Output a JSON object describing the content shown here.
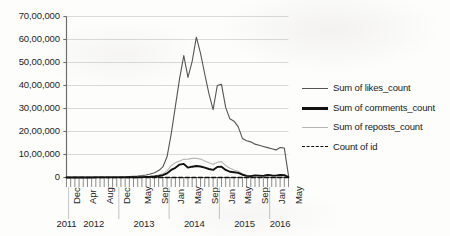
{
  "chart_data": {
    "type": "line",
    "title": "",
    "subtitle": "",
    "xlabel": "",
    "ylabel": "",
    "ylim": [
      0,
      7000000
    ],
    "ytick_labels": [
      "0",
      "10,00,000",
      "20,00,000",
      "30,00,000",
      "40,00,000",
      "50,00,000",
      "60,00,000",
      "70,00,000"
    ],
    "ytick_values": [
      0,
      1000000,
      2000000,
      3000000,
      4000000,
      5000000,
      6000000,
      7000000
    ],
    "grid": "horizontal",
    "legend_position": "right",
    "x_axis_type": "monthly",
    "xtick_labels": [
      "Dec",
      "Apr",
      "Aug",
      "Dec",
      "May",
      "Sep",
      "Jan",
      "May",
      "Sep",
      "Jan",
      "May",
      "Sep",
      "Jan",
      "May"
    ],
    "xtick_month_index": [
      0,
      4,
      8,
      12,
      17,
      21,
      25,
      29,
      33,
      37,
      41,
      45,
      49,
      53
    ],
    "year_groups": [
      {
        "label": "2011",
        "start_index": 0,
        "end_index": 0
      },
      {
        "label": "2012",
        "start_index": 1,
        "end_index": 12
      },
      {
        "label": "2013",
        "start_index": 13,
        "end_index": 24
      },
      {
        "label": "2014",
        "start_index": 25,
        "end_index": 36
      },
      {
        "label": "2015",
        "start_index": 37,
        "end_index": 48
      },
      {
        "label": "2016",
        "start_index": 49,
        "end_index": 53
      }
    ],
    "x": [
      "Dec 2011",
      "Jan 2012",
      "Feb 2012",
      "Mar 2012",
      "Apr 2012",
      "May 2012",
      "Jun 2012",
      "Jul 2012",
      "Aug 2012",
      "Sep 2012",
      "Oct 2012",
      "Nov 2012",
      "Dec 2012",
      "Jan 2013",
      "Feb 2013",
      "Mar 2013",
      "Apr 2013",
      "May 2013",
      "Jun 2013",
      "Jul 2013",
      "Aug 2013",
      "Sep 2013",
      "Oct 2013",
      "Nov 2013",
      "Dec 2013",
      "Jan 2014",
      "Feb 2014",
      "Mar 2014",
      "Apr 2014",
      "May 2014",
      "Jun 2014",
      "Jul 2014",
      "Aug 2014",
      "Sep 2014",
      "Oct 2014",
      "Nov 2014",
      "Dec 2014",
      "Jan 2015",
      "Feb 2015",
      "Mar 2015",
      "Apr 2015",
      "May 2015",
      "Jun 2015",
      "Jul 2015",
      "Aug 2015",
      "Sep 2015",
      "Oct 2015",
      "Nov 2015",
      "Dec 2015",
      "Jan 2016",
      "Feb 2016",
      "Mar 2016",
      "Apr 2016",
      "May 2016"
    ],
    "series": [
      {
        "name": "Sum of likes_count",
        "color": "#555555",
        "width": 1.1,
        "dash": "none",
        "values": [
          8000,
          9000,
          10000,
          11000,
          12000,
          13000,
          14000,
          15000,
          16000,
          17000,
          19000,
          21000,
          24000,
          28000,
          34000,
          42000,
          52000,
          66000,
          85000,
          110000,
          150000,
          210000,
          300000,
          460000,
          900000,
          1900000,
          3100000,
          4300000,
          5300000,
          4350000,
          5050000,
          6100000,
          5400000,
          4500000,
          3650000,
          2950000,
          4000000,
          4050000,
          3050000,
          2550000,
          2450000,
          2200000,
          1700000,
          1600000,
          1550000,
          1450000,
          1400000,
          1350000,
          1300000,
          1250000,
          1200000,
          1300000,
          1280000,
          80000
        ]
      },
      {
        "name": "Sum of comments_count",
        "color": "#111111",
        "width": 1.9,
        "dash": "none",
        "values": [
          2000,
          2200,
          2400,
          2600,
          2800,
          3000,
          3200,
          3500,
          3800,
          4100,
          4500,
          5000,
          5600,
          6400,
          7500,
          9000,
          11000,
          14000,
          18000,
          24000,
          33000,
          47000,
          68000,
          100000,
          180000,
          330000,
          420000,
          560000,
          590000,
          430000,
          470000,
          500000,
          480000,
          430000,
          370000,
          330000,
          460000,
          470000,
          330000,
          250000,
          230000,
          200000,
          120000,
          70000,
          60000,
          90000,
          80000,
          70000,
          110000,
          90000,
          80000,
          110000,
          100000,
          15000
        ]
      },
      {
        "name": "Sum of reposts_count",
        "color": "#b6b6b6",
        "width": 1.1,
        "dash": "none",
        "values": [
          3000,
          3200,
          3500,
          3800,
          4100,
          4400,
          4800,
          5200,
          5700,
          6300,
          7000,
          7900,
          9000,
          10500,
          12500,
          15000,
          18500,
          23000,
          30000,
          40000,
          55000,
          78000,
          112000,
          165000,
          290000,
          520000,
          640000,
          720000,
          790000,
          800000,
          830000,
          840000,
          800000,
          720000,
          640000,
          570000,
          660000,
          690000,
          520000,
          400000,
          330000,
          270000,
          160000,
          90000,
          70000,
          100000,
          90000,
          80000,
          120000,
          100000,
          90000,
          120000,
          110000,
          18000
        ]
      },
      {
        "name": "Count of id",
        "color": "#111111",
        "width": 1.5,
        "dash": "4,2.6",
        "values": [
          60,
          62,
          64,
          66,
          68,
          70,
          72,
          75,
          78,
          81,
          85,
          90,
          96,
          103,
          112,
          122,
          135,
          150,
          170,
          195,
          225,
          265,
          315,
          380,
          470,
          620,
          740,
          840,
          900,
          860,
          890,
          910,
          880,
          830,
          780,
          730,
          810,
          830,
          700,
          620,
          580,
          540,
          440,
          380,
          350,
          400,
          380,
          360,
          420,
          390,
          370,
          420,
          410,
          120
        ]
      }
    ]
  },
  "legend": {
    "items": [
      {
        "label": "Sum of likes_count",
        "icon": "line-swatch-icon"
      },
      {
        "label": "Sum of comments_count",
        "icon": "line-swatch-icon"
      },
      {
        "label": "Sum of reposts_count",
        "icon": "line-swatch-icon"
      },
      {
        "label": "Count of id",
        "icon": "dashed-line-swatch-icon"
      }
    ]
  },
  "colors": {
    "likes": "#555555",
    "comments": "#111111",
    "reposts": "#b6b6b6",
    "count_of_id": "#111111",
    "axis": "#6e6e6e",
    "grid": "#d6d6d6",
    "background": "#fdfdfc"
  }
}
